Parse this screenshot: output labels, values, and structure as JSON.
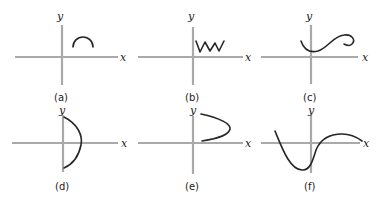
{
  "figure": {
    "axis_labels": {
      "x": "x",
      "y": "y"
    },
    "colors": {
      "axis": "#a9a9a9",
      "curve": "#262626",
      "background": "#ffffff"
    },
    "panels": [
      {
        "id": "a",
        "caption": "(a)",
        "curve": "small arch (semicircle) above x-axis, right of y-axis"
      },
      {
        "id": "b",
        "caption": "(b)",
        "curve": "zigzag (W shape) starting at y-axis, above x-axis"
      },
      {
        "id": "c",
        "caption": "(c)",
        "curve": "S-shaped curve ending in a loop curling back"
      },
      {
        "id": "d",
        "caption": "(d)",
        "curve": "semicircular arc bulging right, endpoints on y-axis"
      },
      {
        "id": "e",
        "caption": "(e)",
        "curve": "parabola opening to the left, above x-axis"
      },
      {
        "id": "f",
        "caption": "(f)",
        "curve": "wave: descends through x-axis, dips to minimum, rises and levels off"
      }
    ]
  }
}
